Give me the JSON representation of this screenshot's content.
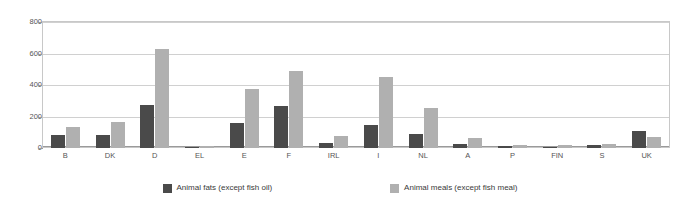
{
  "chart_data": {
    "type": "bar",
    "title": "",
    "subtitle": "",
    "xlabel": "",
    "ylabel": "",
    "ylim": [
      0,
      800
    ],
    "yticks": [
      0,
      200,
      400,
      600,
      800
    ],
    "ytick_labels": [
      "0",
      "200",
      "400",
      "600",
      "800"
    ],
    "grid": true,
    "legend_position": "bottom",
    "categories": [
      "B",
      "DK",
      "D",
      "EL",
      "E",
      "F",
      "IRL",
      "I",
      "NL",
      "A",
      "P",
      "FIN",
      "S",
      "UK"
    ],
    "series": [
      {
        "name": "Animal fats (except fish oil)",
        "color": "#4a4a4a",
        "values": [
          80,
          80,
          270,
          3,
          160,
          265,
          30,
          145,
          90,
          25,
          10,
          8,
          18,
          110
        ]
      },
      {
        "name": "Animal meals (except fish meal)",
        "color": "#b0b0b0",
        "values": [
          135,
          165,
          630,
          10,
          375,
          490,
          75,
          450,
          255,
          65,
          20,
          18,
          25,
          70
        ]
      }
    ]
  },
  "legend": {
    "items": [
      {
        "label": "Animal fats (except fish oil)",
        "swatch": "#4a4a4a"
      },
      {
        "label": "Animal meals (except fish meal)",
        "swatch": "#b0b0b0"
      }
    ]
  },
  "colors": {
    "series_fats": "#4a4a4a",
    "series_meals": "#b0b0b0",
    "gridline": "#d0d0d0",
    "axis": "#9a9a9a",
    "tick_text": "#555555",
    "legend_text": "#3a3a3a",
    "background": "#ffffff"
  }
}
